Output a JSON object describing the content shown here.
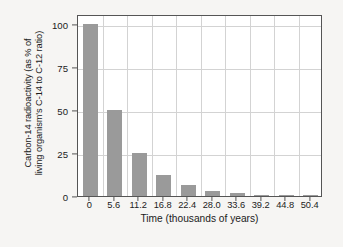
{
  "chart_data": {
    "type": "bar",
    "title": "",
    "xlabel": "Time (thousands of years)",
    "ylabel": "Carbon-14 radioactivity (as % of living organism's C-14 to C-12 ratio)",
    "ylabel_line1": "Carbon-14 radioactivity (as % of",
    "ylabel_line2": "living organism's C-14 to C-12 ratio)",
    "categories": [
      "0",
      "5.6",
      "11.2",
      "16.8",
      "22.4",
      "28.0",
      "33.6",
      "39.2",
      "44.8",
      "50.4"
    ],
    "values": [
      100,
      50,
      25,
      12.5,
      6.25,
      3.13,
      1.56,
      0.78,
      0.39,
      0.2
    ],
    "yticks": [
      0,
      25,
      50,
      75,
      100
    ],
    "ytick_labels": [
      "0",
      "25",
      "50",
      "75",
      "100"
    ],
    "ylim": [
      0,
      106
    ],
    "xtick_labels": [
      "0",
      "5.6",
      "11.2",
      "16.8",
      "22.4",
      "28.0",
      "33.6",
      "39.2",
      "44.8",
      "50.4"
    ],
    "grid": "horizontal-and-vertical",
    "legend": "none",
    "bar_color": "#9a9a9a",
    "grid_color": "#d3d3d3",
    "axis_color": "#555555",
    "plot_background": "#ffffff",
    "figure_background": "#f6f5f3",
    "text_color": "#1b1b1b"
  }
}
